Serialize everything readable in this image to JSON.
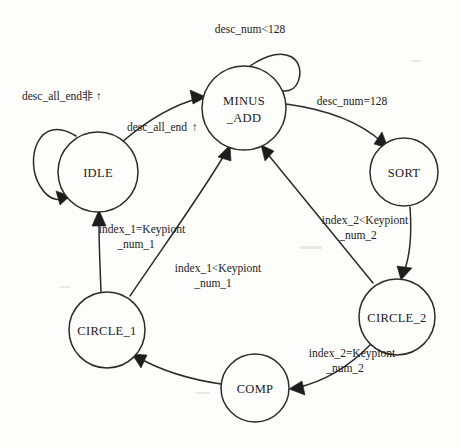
{
  "diagram": {
    "type": "finite-state-machine",
    "title": "",
    "states": [
      {
        "id": "idle",
        "label": "IDLE",
        "label_line2": "",
        "cx": 98,
        "cy": 172,
        "r": 40
      },
      {
        "id": "minus_add",
        "label": "MINUS",
        "label_line2": "_ADD",
        "cx": 244,
        "cy": 108,
        "r": 42
      },
      {
        "id": "sort",
        "label": "SORT",
        "label_line2": "",
        "cx": 404,
        "cy": 172,
        "r": 34
      },
      {
        "id": "circle_2",
        "label": "CIRCLE_2",
        "label_line2": "",
        "cx": 397,
        "cy": 317,
        "r": 38
      },
      {
        "id": "comp",
        "label": "COMP",
        "label_line2": "",
        "cx": 255,
        "cy": 388,
        "r": 34
      },
      {
        "id": "circle_1",
        "label": "CIRCLE_1",
        "label_line2": "",
        "cx": 107,
        "cy": 330,
        "r": 38
      }
    ],
    "transitions": [
      {
        "id": "idle-self",
        "from": "idle",
        "to": "idle",
        "label_line1": "desc_all_end",
        "label_cjk": "非",
        "label_arrow": "↑",
        "label_line2": "",
        "label_x": 76,
        "label_y": 100
      },
      {
        "id": "idle-to-minus-add",
        "from": "idle",
        "to": "minus_add",
        "label_line1": "desc_all_end",
        "label_cjk": "",
        "label_arrow": "↑",
        "label_line2": "",
        "label_x": 170,
        "label_y": 131
      },
      {
        "id": "minus-add-self",
        "from": "minus_add",
        "to": "minus_add",
        "label_line1": "desc_num<128",
        "label_cjk": "",
        "label_arrow": "",
        "label_line2": "",
        "label_x": 250,
        "label_y": 33
      },
      {
        "id": "minus-add-to-sort",
        "from": "minus_add",
        "to": "sort",
        "label_line1": "desc_num=128",
        "label_cjk": "",
        "label_arrow": "",
        "label_line2": "",
        "label_x": 352,
        "label_y": 105
      },
      {
        "id": "sort-to-circle-2",
        "from": "sort",
        "to": "circle_2",
        "label_line1": "",
        "label_cjk": "",
        "label_arrow": "",
        "label_line2": "",
        "label_x": 0,
        "label_y": 0
      },
      {
        "id": "circle-2-to-minus-add",
        "from": "circle_2",
        "to": "minus_add",
        "label_line1": "index_2<Keypiont",
        "label_cjk": "",
        "label_arrow": "",
        "label_line2": "_num_2",
        "label_x": 361,
        "label_y": 224
      },
      {
        "id": "circle-2-to-comp",
        "from": "circle_2",
        "to": "comp",
        "label_line1": "index_2=Keypiont",
        "label_cjk": "",
        "label_arrow": "",
        "label_line2": "_num_2",
        "label_x": 352,
        "label_y": 357
      },
      {
        "id": "comp-to-circle-1",
        "from": "comp",
        "to": "circle_1",
        "label_line1": "",
        "label_cjk": "",
        "label_arrow": "",
        "label_line2": "",
        "label_x": 0,
        "label_y": 0
      },
      {
        "id": "circle-1-to-minus-add",
        "from": "circle_1",
        "to": "minus_add",
        "label_line1": "index_1<Keypiont",
        "label_cjk": "",
        "label_arrow": "",
        "label_line2": "_num_1",
        "label_x": 216,
        "label_y": 272
      },
      {
        "id": "circle-1-to-idle",
        "from": "circle_1",
        "to": "idle",
        "label_line1": "index_1=Keypiont",
        "label_cjk": "",
        "label_arrow": "",
        "label_line2": "_num_1",
        "label_x": 141,
        "label_y": 233
      }
    ]
  }
}
